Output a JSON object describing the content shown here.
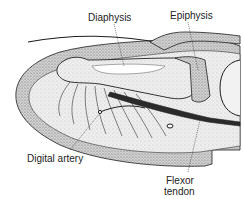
{
  "diagram": {
    "colors": {
      "ink": "#1e1e1e",
      "skin_stipple": "#8a8a8a",
      "pulp_fill": "#e4e4e4",
      "bone_fill": "#f2f2f2",
      "background": "#ffffff"
    },
    "labels": [
      {
        "id": "diaphysis",
        "text": "Diaphysis",
        "x": 88,
        "y": 12,
        "pointer": [
          120,
          66
        ]
      },
      {
        "id": "epiphysis",
        "text": "Epiphysis",
        "x": 170,
        "y": 10,
        "pointer": [
          196,
          70
        ]
      },
      {
        "id": "digital_artery",
        "text": "Digital artery",
        "x": 27,
        "y": 153,
        "pointer": [
          100,
          112
        ]
      },
      {
        "id": "flexor_tendon_line1",
        "text": "Flexor",
        "x": 166,
        "y": 175,
        "pointer": [
          198,
          118
        ]
      },
      {
        "id": "flexor_tendon_line2",
        "text": "tendon",
        "x": 164,
        "y": 186
      }
    ]
  }
}
